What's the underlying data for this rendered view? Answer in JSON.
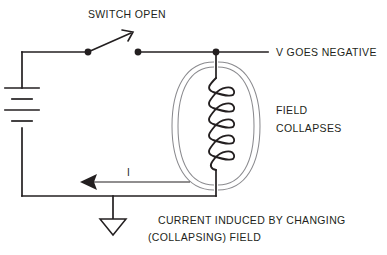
{
  "figure": {
    "title_visible": false,
    "background_color": "#ffffff",
    "line_color": "#231f20",
    "field_line_color": "#8b8b8f"
  },
  "labels": {
    "switch_open": "SWITCH OPEN",
    "v_goes_negative": "V GOES NEGATIVE",
    "field_line1": "FIELD",
    "field_line2": "COLLAPSES",
    "current_symbol": "I",
    "caption_line1": "CURRENT INDUCED BY CHANGING",
    "caption_line2": "(COLLAPSING) FIELD"
  },
  "components": {
    "battery": {
      "name": "battery",
      "plates": 4,
      "orientation": "vertical"
    },
    "switch": {
      "name": "switch",
      "state": "open"
    },
    "inductor": {
      "name": "inductor-coil",
      "turns": 6
    },
    "ground": {
      "name": "ground-symbol",
      "style": "open-triangle"
    },
    "current_arrow": {
      "name": "current-arrow",
      "direction": "left"
    },
    "field_lines": {
      "name": "magnetic-field-lines",
      "count": 4,
      "shape": "nested-ellipse-arcs"
    },
    "nodes": {
      "name": "junction-dots",
      "count": 3
    }
  }
}
